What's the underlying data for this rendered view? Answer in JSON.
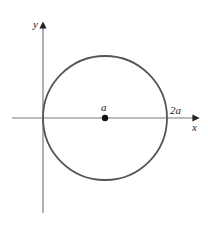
{
  "diagram": {
    "type": "circle-on-axes",
    "labels": {
      "y_axis": "y",
      "x_axis": "x",
      "center": "a",
      "right_intercept": "2a"
    },
    "colors": {
      "axes": "#7a7a7a",
      "circle": "#555555",
      "point": "#111111",
      "text": "#222222"
    }
  }
}
